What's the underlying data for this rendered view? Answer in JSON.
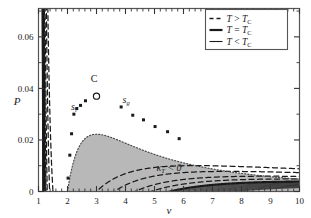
{
  "figure": {
    "title": "",
    "background": "#ffffff",
    "frame_color": "#555555"
  },
  "axes": {
    "x": {
      "label": "v",
      "min": 1,
      "max": 10,
      "ticks": [
        1,
        2,
        3,
        4,
        5,
        6,
        7,
        8,
        9,
        10
      ],
      "tick_labels": [
        "1",
        "2",
        "3",
        "4",
        "5",
        "6",
        "7",
        "8",
        "9",
        "10"
      ],
      "minor_per_major": 5
    },
    "y": {
      "label": "P",
      "min": 0,
      "max": 0.071,
      "ticks": [
        0,
        0.02,
        0.04,
        0.06
      ],
      "tick_labels": [
        "0",
        "0.02",
        "0.04",
        "0.06"
      ],
      "minor_per_major": 2
    }
  },
  "legend": {
    "position": "top-right",
    "border_color": "#555555",
    "entries": [
      {
        "style": "dashed",
        "lhs": "T",
        "rel": ">",
        "rhs": "T",
        "rhs_sub": "C",
        "label": "T > TC"
      },
      {
        "style": "thick",
        "lhs": "T",
        "rel": "=",
        "rhs": "T",
        "rhs_sub": "C",
        "label": "T = TC"
      },
      {
        "style": "solid",
        "lhs": "T",
        "rel": "<",
        "rhs": "T",
        "rhs_sub": "C",
        "label": "T < TC"
      }
    ]
  },
  "annotations": [
    {
      "name": "critical-point-label",
      "text": "C",
      "v": 2.92,
      "P": 0.0425,
      "style": "upright"
    },
    {
      "name": "liquid-spinodal-label",
      "text": "s",
      "sub": "l",
      "v": 2.22,
      "P": 0.0318,
      "style": "italic"
    },
    {
      "name": "gas-spinodal-label",
      "text": "s",
      "sub": "g",
      "v": 4.02,
      "P": 0.0345,
      "style": "italic"
    },
    {
      "name": "negative-compressibility-label",
      "text": "κ",
      "sub": "T",
      "tail": " < 0",
      "v": 5.5,
      "P": 0.0078,
      "style": "italic"
    }
  ],
  "chart_data": {
    "type": "line",
    "xlabel": "v",
    "ylabel": "P",
    "xlim": [
      1,
      10
    ],
    "ylim": [
      0,
      0.071
    ],
    "grid": false,
    "legend_position": "top-right",
    "model": {
      "equation": "P = T/(v - b) - a/v^2",
      "a": 0.6,
      "b": 1.0,
      "T_critical": 0.08889,
      "v_critical": 3.0,
      "P_critical": 0.03704
    },
    "critical_point": {
      "v": 3.0,
      "P": 0.037,
      "marker": "open-circle"
    },
    "series": [
      {
        "name": "T > TC (4)",
        "style": "dashed",
        "T_values": [
          0.1333,
          0.12,
          0.1067,
          0.0978
        ]
      },
      {
        "name": "T = TC",
        "style": "thick",
        "T_values": [
          0.08889
        ]
      },
      {
        "name": "T < TC (8)",
        "style": "solid",
        "T_values": [
          0.0862,
          0.0836,
          0.0809,
          0.0782,
          0.0756,
          0.0729,
          0.0702,
          0.0676
        ]
      }
    ],
    "spinodal": {
      "name": "spinodal-curve",
      "style": "dotted",
      "equation": "P = a(v - 2b)/v^3",
      "shaded_region_color": "#b8b8b8",
      "region_label": "kappa_T < 0",
      "points_v": [
        2.0,
        2.2,
        2.4,
        2.6,
        2.8,
        3.0,
        3.4,
        4.0,
        4.6,
        5.2,
        5.8,
        6.6,
        7.6,
        8.6,
        10.0
      ],
      "points_P": [
        0.0,
        0.0113,
        0.0174,
        0.021,
        0.0231,
        0.0222,
        0.0214,
        0.0188,
        0.0164,
        0.0144,
        0.0127,
        0.0108,
        0.0089,
        0.0074,
        0.0059
      ]
    },
    "spinodal_markers": {
      "name": "spinodal-intersection-markers",
      "marker": "filled-square",
      "liquid_branch_v": [
        2.02,
        2.08,
        2.14,
        2.22,
        2.32,
        2.45,
        2.62
      ],
      "liquid_branch_P": [
        0.0052,
        0.0141,
        0.0224,
        0.03,
        0.0322,
        0.0334,
        0.0352
      ],
      "gas_branch_v": [
        3.85,
        4.25,
        4.62,
        5.02,
        5.45,
        5.85
      ],
      "gas_branch_P": [
        0.0328,
        0.0296,
        0.0278,
        0.0252,
        0.0232,
        0.0205
      ]
    }
  }
}
